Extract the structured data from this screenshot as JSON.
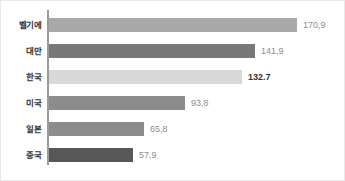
{
  "chart_data": {
    "type": "bar",
    "orientation": "horizontal",
    "title": "",
    "subtitle": "",
    "xlabel": "",
    "ylabel": "",
    "grid": false,
    "legend": null,
    "xlim": [
      0,
      170.9
    ],
    "categories": [
      "벨기에",
      "대만",
      "한국",
      "미국",
      "일본",
      "중국"
    ],
    "values": [
      170.9,
      141.9,
      132.7,
      93.8,
      65.8,
      57.9
    ],
    "value_labels": [
      "170,9",
      "141,9",
      "132.7",
      "93,8",
      "65,8",
      "57,9"
    ],
    "bar_colors": [
      "#a9a9a9",
      "#787878",
      "#d8d8d8",
      "#8c8c8c",
      "#8c8c8c",
      "#575757"
    ],
    "label_emphasis": [
      false,
      false,
      true,
      false,
      false,
      true
    ],
    "highlighted_category": "한국",
    "axis_color": "#9a9a9a"
  },
  "rows": [
    {
      "category": "벨기에",
      "value": 170.9,
      "label": "170,9",
      "color": "#a9a9a9",
      "emphasis": false
    },
    {
      "category": "대만",
      "value": 141.9,
      "label": "141,9",
      "color": "#787878",
      "emphasis": false
    },
    {
      "category": "한국",
      "value": 132.7,
      "label": "132.7",
      "color": "#d8d8d8",
      "emphasis": true
    },
    {
      "category": "미국",
      "value": 93.8,
      "label": "93,8",
      "color": "#8c8c8c",
      "emphasis": false
    },
    {
      "category": "일본",
      "value": 65.8,
      "label": "65,8",
      "color": "#8c8c8c",
      "emphasis": false
    },
    {
      "category": "중국",
      "value": 57.9,
      "label": "57,9",
      "color": "#575757",
      "emphasis": false
    }
  ]
}
